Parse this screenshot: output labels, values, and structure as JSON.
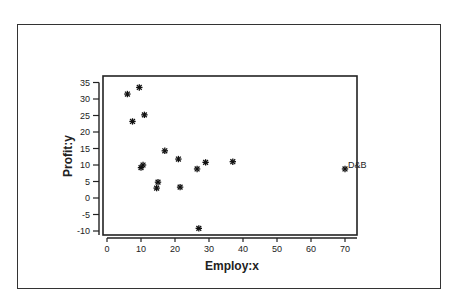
{
  "chart_data": {
    "type": "scatter",
    "title": "",
    "xlabel": "Employ:x",
    "ylabel": "Profit:y",
    "xlim": [
      -1,
      74
    ],
    "ylim": [
      -11.5,
      37
    ],
    "xticks": [
      0,
      10,
      20,
      30,
      40,
      50,
      60,
      70
    ],
    "yticks": [
      -10,
      -5,
      0,
      5,
      10,
      15,
      20,
      25,
      30,
      35
    ],
    "grid": false,
    "marker": "asterisk",
    "points": [
      {
        "x": 6,
        "y": 31.5
      },
      {
        "x": 9.5,
        "y": 33.5
      },
      {
        "x": 7.5,
        "y": 23.2
      },
      {
        "x": 11,
        "y": 25.2
      },
      {
        "x": 17,
        "y": 14.3
      },
      {
        "x": 21,
        "y": 11.8
      },
      {
        "x": 10.6,
        "y": 10
      },
      {
        "x": 10,
        "y": 9.2
      },
      {
        "x": 29,
        "y": 10.8
      },
      {
        "x": 26.5,
        "y": 8.8
      },
      {
        "x": 37,
        "y": 11
      },
      {
        "x": 15,
        "y": 4.8
      },
      {
        "x": 14.6,
        "y": 3
      },
      {
        "x": 21.5,
        "y": 3.3
      },
      {
        "x": 27,
        "y": -9.2
      },
      {
        "x": 70,
        "y": 8.8,
        "label": "D&B"
      }
    ]
  }
}
